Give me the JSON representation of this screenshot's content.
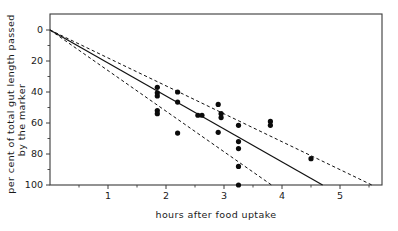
{
  "figure": {
    "background_color": "#ffffff",
    "ink_color": "#111111"
  },
  "chart_data": {
    "type": "scatter",
    "title": "",
    "subtitle": "",
    "xlabel": "hours after food uptake",
    "ylabel": "per cent of total gut length passed by the marker",
    "ylabel_line1": "per cent of total gut length passed",
    "ylabel_line2": "by the marker",
    "xlim": [
      0,
      5.72
    ],
    "ylim": [
      0,
      100
    ],
    "y_axis_inverted": true,
    "grid": false,
    "legend": null,
    "legend_position": "none",
    "x_ticks": [
      1,
      2,
      3,
      4,
      5
    ],
    "x_tick_labels": [
      "1",
      "2",
      "3",
      "4",
      "5"
    ],
    "x_minor_ticks": [
      0.5,
      1.5,
      2.5,
      3.5,
      4.5,
      5.5
    ],
    "y_ticks": [
      0,
      20,
      40,
      60,
      80,
      100
    ],
    "y_tick_labels": [
      "0",
      "20",
      "40",
      "60",
      "80",
      "100"
    ],
    "y_minor_ticks": [
      10,
      30,
      50,
      70,
      90
    ],
    "points": [
      {
        "x": 1.85,
        "y": 37.0
      },
      {
        "x": 1.85,
        "y": 40.5
      },
      {
        "x": 1.85,
        "y": 42.5
      },
      {
        "x": 1.85,
        "y": 52.0
      },
      {
        "x": 1.85,
        "y": 54.0
      },
      {
        "x": 2.2,
        "y": 40.0
      },
      {
        "x": 2.2,
        "y": 46.5
      },
      {
        "x": 2.2,
        "y": 66.5
      },
      {
        "x": 2.55,
        "y": 55.0
      },
      {
        "x": 2.62,
        "y": 55.0
      },
      {
        "x": 2.9,
        "y": 48.0
      },
      {
        "x": 2.9,
        "y": 66.0
      },
      {
        "x": 2.95,
        "y": 54.0
      },
      {
        "x": 2.95,
        "y": 56.5
      },
      {
        "x": 3.25,
        "y": 61.5
      },
      {
        "x": 3.25,
        "y": 72.0
      },
      {
        "x": 3.25,
        "y": 76.5
      },
      {
        "x": 3.25,
        "y": 88.0
      },
      {
        "x": 3.25,
        "y": 100.0
      },
      {
        "x": 3.8,
        "y": 59.0
      },
      {
        "x": 3.8,
        "y": 61.5
      },
      {
        "x": 4.5,
        "y": 83.0
      }
    ],
    "lines": [
      {
        "name": "regression-line",
        "style": "solid",
        "points": [
          [
            0,
            0
          ],
          [
            4.7,
            100
          ]
        ]
      },
      {
        "name": "upper-confidence-limit",
        "style": "dashed",
        "points": [
          [
            0,
            0
          ],
          [
            5.55,
            100
          ]
        ]
      },
      {
        "name": "lower-confidence-limit",
        "style": "dashed",
        "points": [
          [
            0,
            0
          ],
          [
            3.82,
            100
          ]
        ]
      }
    ]
  }
}
